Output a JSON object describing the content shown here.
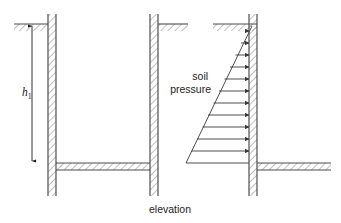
{
  "figure": {
    "caption": "elevation",
    "dimension_label": {
      "base": "h",
      "subscript": "1"
    },
    "pressure_label": {
      "line1": "soil",
      "line2": "pressure"
    },
    "colors": {
      "line": "#4d4d4d",
      "hatch": "#8a8a8a",
      "text": "#222222",
      "arrow": "#3a3a3a",
      "background": "#ffffff"
    },
    "panels": [
      {
        "name": "structure-elevation",
        "description": "Two vertical walls with ground surface at top and floor slab at base"
      },
      {
        "name": "pressure-elevation",
        "description": "Wall with triangular soil pressure distribution of horizontal arrows"
      }
    ],
    "pressure_arrow_count": 11,
    "pressure_arrow_rows": [
      {
        "y": 31,
        "x_start": 246.5
      },
      {
        "y": 43,
        "x_start": 241.0
      },
      {
        "y": 55,
        "x_start": 235.5
      },
      {
        "y": 67,
        "x_start": 230.0
      },
      {
        "y": 79,
        "x_start": 224.5
      },
      {
        "y": 91,
        "x_start": 219.0
      },
      {
        "y": 103,
        "x_start": 213.5
      },
      {
        "y": 115,
        "x_start": 208.0
      },
      {
        "y": 127,
        "x_start": 202.5
      },
      {
        "y": 139,
        "x_start": 197.0
      },
      {
        "y": 151,
        "x_start": 191.5
      }
    ],
    "geometry": {
      "left_wall_x": 48,
      "middle_wall_x": 158,
      "right_wall_x": 257,
      "ground_y": 24,
      "floor_y": 163,
      "wall_bottom_y": 196,
      "dimension_x": 32,
      "dimension_top_y": 26,
      "dimension_bottom_y": 161,
      "triangle_apex_x": 186,
      "triangle_apex_y": 163,
      "triangle_top_y": 26
    }
  }
}
